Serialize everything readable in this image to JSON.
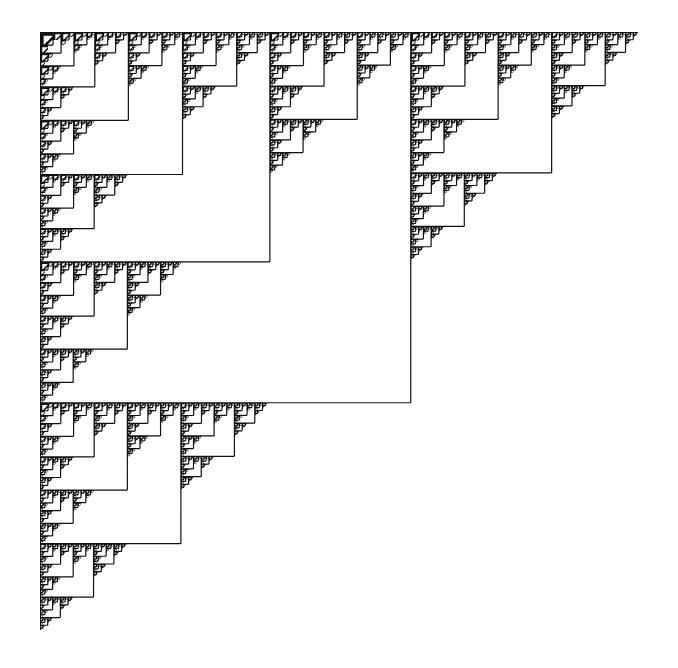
{
  "figure": {
    "background_color": "#ffffff",
    "ink_color": "#111111",
    "bounds": {
      "x": 40,
      "y": 32,
      "size": 598
    },
    "split_ratio": 0.62,
    "depth": 8,
    "subdivision": [
      "top-left (large copy)",
      "top-right (small copy)",
      "bottom-left (small copy)",
      "bottom-right (empty)"
    ]
  }
}
